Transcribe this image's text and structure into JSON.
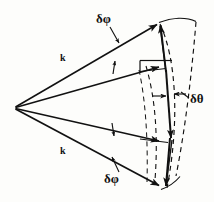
{
  "figure": {
    "background_color": "#fdfdfb",
    "ink_color": "#111111",
    "width": 214,
    "height": 202,
    "labels": {
      "delta_phi_top": "δφ",
      "delta_phi_bottom": "δφ",
      "delta_theta": "δθ",
      "k_upper": "k",
      "k_lower": "k"
    },
    "geometry": {
      "apex": {
        "x": 15,
        "y": 107
      },
      "rays": [
        {
          "name": "ray-upper-outer",
          "from": [
            15,
            107
          ],
          "to": [
            160,
            22
          ],
          "style": "solid",
          "arrow": true
        },
        {
          "name": "ray-upper-inner",
          "from": [
            15,
            107
          ],
          "to": [
            163,
            66
          ],
          "style": "solid",
          "arrow": true
        },
        {
          "name": "ray-lower-inner",
          "from": [
            15,
            107
          ],
          "to": [
            163,
            142
          ],
          "style": "solid",
          "arrow": true
        },
        {
          "name": "ray-lower-outer",
          "from": [
            15,
            107
          ],
          "to": [
            163,
            188
          ],
          "style": "solid",
          "arrow": true
        }
      ],
      "spine": {
        "name": "vertical-spine",
        "from": [
          160,
          22
        ],
        "to": [
          168,
          188
        ],
        "style": "solid",
        "arrow": true
      },
      "arcs": [
        {
          "name": "arc-outer-dashed",
          "style": "dashed"
        },
        {
          "name": "arc-inner-dashed",
          "style": "dashed"
        },
        {
          "name": "arc-top-solid",
          "style": "solid"
        },
        {
          "name": "arc-bottom-solid",
          "style": "solid"
        }
      ],
      "brackets": [
        {
          "name": "bracket-mid-horizontal",
          "style": "solid"
        }
      ],
      "tick_arrows": [
        {
          "name": "tick-upper-mid",
          "style": "solid"
        },
        {
          "name": "tick-lower-mid",
          "style": "solid"
        },
        {
          "name": "delta-theta-arrow-left",
          "style": "solid"
        },
        {
          "name": "delta-theta-arrow-right",
          "style": "solid"
        }
      ],
      "leaders": [
        {
          "name": "leader-delta-phi-top",
          "from": [
            111,
            28
          ],
          "to": [
            120,
            44
          ]
        },
        {
          "name": "leader-delta-phi-bottom",
          "from": [
            119,
            170
          ],
          "to": [
            112,
            156
          ]
        },
        {
          "name": "leader-delta-theta",
          "from": [
            188,
            97
          ],
          "to": [
            175,
            92
          ]
        }
      ]
    }
  }
}
